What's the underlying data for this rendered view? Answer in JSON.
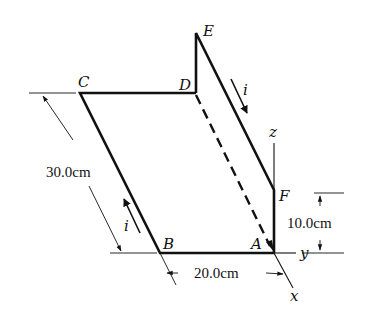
{
  "diagram": {
    "colors": {
      "stroke": "#111111",
      "background": "#ffffff"
    },
    "points": {
      "A": "A",
      "B": "B",
      "C": "C",
      "D": "D",
      "E": "E",
      "F": "F"
    },
    "axes": {
      "x": "x",
      "y": "y",
      "z": "z"
    },
    "current_label": "i",
    "dimensions": {
      "side_BC": "30.0cm",
      "side_AB": "20.0cm",
      "height_AF": "10.0cm"
    }
  }
}
